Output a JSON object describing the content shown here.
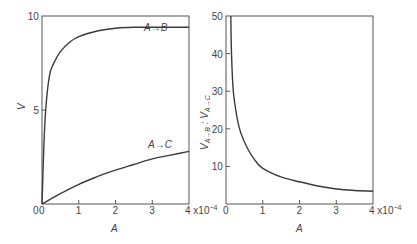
{
  "chart_data": [
    {
      "type": "line",
      "title": "",
      "xlabel": "A",
      "ylabel": "V",
      "x_multiplier_label": "x10^-4",
      "xlim": [
        0,
        4
      ],
      "ylim": [
        0,
        10
      ],
      "xticks": [
        "0",
        "1",
        "2",
        "3",
        "4"
      ],
      "yticks": [
        "0",
        "5",
        "10"
      ],
      "grid": false,
      "series": [
        {
          "name": "A→B",
          "x": [
            0,
            0.05,
            0.1,
            0.2,
            0.3,
            0.5,
            0.75,
            1.0,
            1.5,
            2.0,
            2.5,
            3.0,
            3.5,
            4.0
          ],
          "y": [
            0,
            3.0,
            5.0,
            6.8,
            7.4,
            8.1,
            8.6,
            8.9,
            9.2,
            9.35,
            9.4,
            9.4,
            9.4,
            9.4
          ]
        },
        {
          "name": "A→C",
          "x": [
            0,
            0.5,
            1.0,
            1.5,
            2.0,
            2.5,
            3.0,
            3.5,
            4.0
          ],
          "y": [
            0,
            0.55,
            1.05,
            1.45,
            1.8,
            2.1,
            2.4,
            2.6,
            2.8
          ]
        }
      ],
      "annotations": [
        "A→B",
        "A→C"
      ]
    },
    {
      "type": "line",
      "title": "",
      "xlabel": "A",
      "ylabel": "V A→B : V A→C",
      "x_multiplier_label": "x10^-4",
      "xlim": [
        0,
        4
      ],
      "ylim": [
        0,
        50
      ],
      "xticks": [
        "0",
        "1",
        "2",
        "3",
        "4"
      ],
      "yticks": [
        "10",
        "20",
        "30",
        "40",
        "50"
      ],
      "grid": false,
      "series": [
        {
          "name": "V A→B : V A→C",
          "x": [
            0.13,
            0.15,
            0.2,
            0.3,
            0.4,
            0.6,
            0.8,
            1.0,
            1.5,
            2.0,
            2.5,
            3.0,
            3.5,
            4.0
          ],
          "y": [
            50,
            40,
            30,
            23,
            19,
            14.5,
            11.5,
            9.5,
            7.2,
            5.9,
            4.8,
            4.0,
            3.6,
            3.4
          ]
        }
      ]
    }
  ],
  "labels": {
    "left_ylabel": "V",
    "right_ylabel_main": "V",
    "right_ylabel_sub1": "A→B",
    "right_ylabel_sep": " : ",
    "right_ylabel_sub2": "A→C",
    "xlabel": "A",
    "x_mult": "4 x10",
    "x_exp": "−4",
    "ann_ab": "A→B",
    "ann_ac": "A→C"
  }
}
